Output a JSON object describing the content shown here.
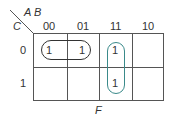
{
  "kmap": {
    "row_var": "C",
    "col_vars": "A B",
    "col_headers": [
      "00",
      "01",
      "11",
      "10"
    ],
    "row_headers": [
      "0",
      "1"
    ],
    "cells": [
      [
        "1",
        "1",
        "1",
        ""
      ],
      [
        "",
        "",
        "1",
        ""
      ]
    ],
    "function_label": "F",
    "groups": [
      {
        "name": "A'C'",
        "color": "#333333"
      },
      {
        "name": "AB",
        "color": "#3a8a8a"
      }
    ]
  }
}
